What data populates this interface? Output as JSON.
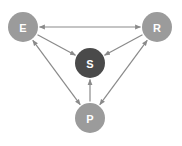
{
  "diagram": {
    "type": "directed-graph",
    "colors": {
      "node_default": "#9b9b9b",
      "node_center": "#4a4a4a",
      "edge": "#8a8a8a",
      "label": "#ffffff",
      "background": "#ffffff"
    },
    "nodes": [
      {
        "id": "E",
        "label": "E",
        "x": 23,
        "y": 27,
        "r": 15,
        "role": "corner"
      },
      {
        "id": "R",
        "label": "R",
        "x": 157,
        "y": 27,
        "r": 15,
        "role": "corner"
      },
      {
        "id": "S",
        "label": "S",
        "x": 90,
        "y": 63,
        "r": 15,
        "role": "center"
      },
      {
        "id": "P",
        "label": "P",
        "x": 90,
        "y": 118,
        "r": 15,
        "role": "corner"
      }
    ],
    "edges": [
      {
        "from": "E",
        "to": "R",
        "bidirectional": true
      },
      {
        "from": "E",
        "to": "S",
        "bidirectional": false
      },
      {
        "from": "R",
        "to": "S",
        "bidirectional": false
      },
      {
        "from": "P",
        "to": "S",
        "bidirectional": false
      },
      {
        "from": "E",
        "to": "P",
        "bidirectional": true
      },
      {
        "from": "R",
        "to": "P",
        "bidirectional": true
      }
    ]
  }
}
